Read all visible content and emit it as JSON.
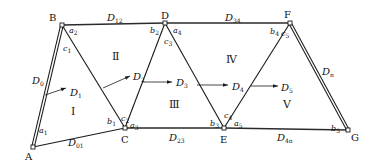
{
  "diagram": {
    "nodes": [
      {
        "id": "A",
        "label": "A"
      },
      {
        "id": "B",
        "label": "B"
      },
      {
        "id": "C",
        "label": "C"
      },
      {
        "id": "D",
        "label": "D"
      },
      {
        "id": "E",
        "label": "E"
      },
      {
        "id": "F",
        "label": "F"
      },
      {
        "id": "G",
        "label": "G"
      }
    ],
    "members": [
      {
        "from": "A",
        "to": "B",
        "label": "D",
        "sub": "0",
        "style": "double"
      },
      {
        "from": "B",
        "to": "D",
        "label": "D",
        "sub": "12",
        "style": "chord"
      },
      {
        "from": "D",
        "to": "F",
        "label": "D",
        "sub": "34",
        "style": "chord"
      },
      {
        "from": "F",
        "to": "G",
        "label": "D",
        "sub": "n",
        "style": "double"
      },
      {
        "from": "A",
        "to": "C",
        "label": "D",
        "sub": "01",
        "style": "single"
      },
      {
        "from": "C",
        "to": "E",
        "label": "D",
        "sub": "23",
        "style": "chord"
      },
      {
        "from": "E",
        "to": "G",
        "label": "D",
        "sub": "4n",
        "style": "chord"
      },
      {
        "from": "B",
        "to": "C",
        "style": "single"
      },
      {
        "from": "C",
        "to": "D",
        "style": "single"
      },
      {
        "from": "D",
        "to": "E",
        "style": "single"
      },
      {
        "from": "E",
        "to": "F",
        "style": "single"
      }
    ],
    "regions": [
      "Ⅰ",
      "Ⅱ",
      "Ⅲ",
      "Ⅳ",
      "Ⅴ"
    ],
    "arrows": [
      {
        "label": "D",
        "sub": "1"
      },
      {
        "label": "D",
        "sub": "2"
      },
      {
        "label": "D",
        "sub": "3"
      },
      {
        "label": "D",
        "sub": "4"
      },
      {
        "label": "D",
        "sub": "5"
      }
    ],
    "angles": {
      "a1": {
        "l": "a",
        "s": "1"
      },
      "a2": {
        "l": "a",
        "s": "2"
      },
      "a3": {
        "l": "a",
        "s": "3"
      },
      "a4": {
        "l": "a",
        "s": "4"
      },
      "a5": {
        "l": "a",
        "s": "5"
      },
      "b1": {
        "l": "b",
        "s": "1"
      },
      "b2": {
        "l": "b",
        "s": "2"
      },
      "b3": {
        "l": "b",
        "s": "3"
      },
      "b4": {
        "l": "b",
        "s": "4"
      },
      "b5": {
        "l": "b",
        "s": "5"
      },
      "c1": {
        "l": "c",
        "s": "1"
      },
      "c2": {
        "l": "c",
        "s": "2"
      },
      "c3": {
        "l": "c",
        "s": "3"
      },
      "c4": {
        "l": "c",
        "s": "4"
      },
      "c5": {
        "l": "c",
        "s": "5"
      }
    }
  }
}
